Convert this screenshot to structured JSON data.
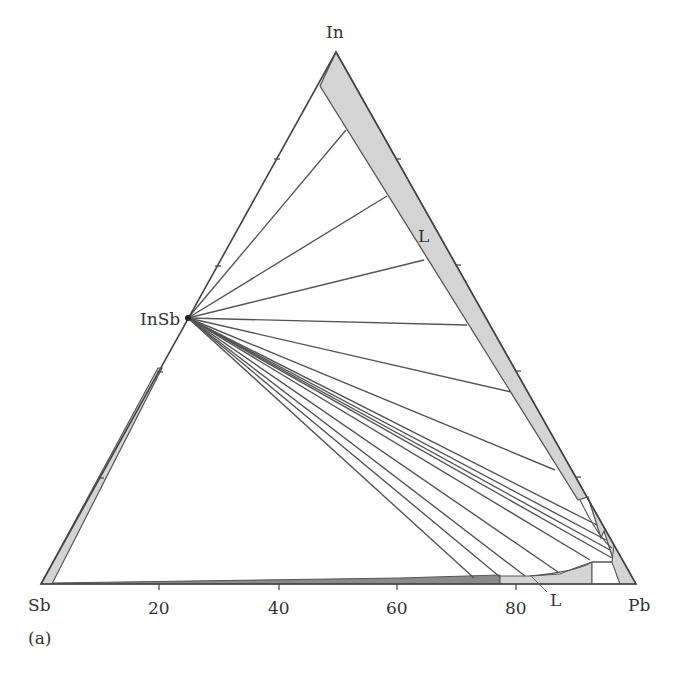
{
  "figure": {
    "panel_label": "(a)",
    "vertices": {
      "top": "In",
      "left": "Sb",
      "right": "Pb"
    },
    "compound_label": "InSb",
    "phase_labels": {
      "liquid_upper": "L",
      "liquid_lower": "L"
    },
    "bottom_axis_ticks": [
      "20",
      "40",
      "60",
      "80"
    ],
    "colors": {
      "line": "#555555",
      "fill_liquid": "#d4d4d4",
      "fill_dark": "#8a8a8a",
      "background": "#ffffff"
    }
  }
}
